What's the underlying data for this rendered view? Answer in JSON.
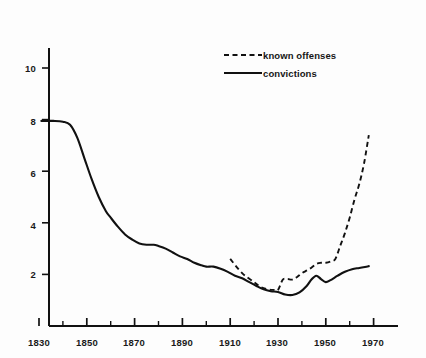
{
  "chart_data": {
    "type": "line",
    "title": "",
    "subtitle": "",
    "xlabel": "",
    "ylabel": "",
    "xlim": [
      1830,
      1976
    ],
    "ylim": [
      0,
      11
    ],
    "grid": false,
    "legend_position": "top-right",
    "y_ticks": [
      2,
      4,
      6,
      8,
      10
    ],
    "y_tick_labels": [
      "2",
      "4",
      "6",
      "8",
      "10"
    ],
    "x_ticks_major": [
      1830,
      1850,
      1870,
      1890,
      1910,
      1930,
      1950,
      1970
    ],
    "x_tick_labels": [
      "1830",
      "1850",
      "1870",
      "1890",
      "1910",
      "1930",
      "1950",
      "1970"
    ],
    "x_ticks_minor": [
      1840,
      1860,
      1880,
      1900,
      1920,
      1940,
      1960
    ],
    "series": [
      {
        "name": "known offenses",
        "style": "dashed",
        "color": "#111111",
        "x": [
          1910,
          1915,
          1920,
          1923,
          1926,
          1928,
          1930,
          1932,
          1934,
          1936,
          1938,
          1940,
          1943,
          1946,
          1948,
          1950,
          1952,
          1954,
          1956,
          1958,
          1960,
          1962,
          1964,
          1966,
          1968
        ],
        "values": [
          2.6,
          2.05,
          1.7,
          1.5,
          1.42,
          1.4,
          1.4,
          1.8,
          1.82,
          1.8,
          1.9,
          2.05,
          2.2,
          2.4,
          2.45,
          2.45,
          2.5,
          2.6,
          3.1,
          3.6,
          4.2,
          4.9,
          5.5,
          6.3,
          7.4
        ]
      },
      {
        "name": "convictions",
        "style": "solid",
        "color": "#111111",
        "x": [
          1831,
          1836,
          1840,
          1843,
          1846,
          1849,
          1852,
          1855,
          1858,
          1860,
          1863,
          1866,
          1869,
          1872,
          1875,
          1878,
          1880,
          1883,
          1886,
          1889,
          1892,
          1895,
          1898,
          1900,
          1903,
          1906,
          1909,
          1912,
          1915,
          1918,
          1921,
          1924,
          1927,
          1930,
          1933,
          1936,
          1939,
          1942,
          1944,
          1946,
          1948,
          1950,
          1952,
          1955,
          1958,
          1961,
          1964,
          1967,
          1968
        ],
        "values": [
          7.95,
          7.95,
          7.92,
          7.8,
          7.3,
          6.5,
          5.7,
          5.0,
          4.45,
          4.2,
          3.85,
          3.55,
          3.35,
          3.2,
          3.15,
          3.15,
          3.1,
          3.0,
          2.85,
          2.7,
          2.6,
          2.45,
          2.35,
          2.3,
          2.3,
          2.22,
          2.1,
          1.95,
          1.85,
          1.7,
          1.55,
          1.42,
          1.35,
          1.32,
          1.22,
          1.2,
          1.3,
          1.55,
          1.8,
          1.95,
          1.82,
          1.7,
          1.78,
          1.95,
          2.1,
          2.2,
          2.25,
          2.3,
          2.32
        ]
      }
    ]
  },
  "legend": {
    "entries": [
      {
        "label": "known offenses",
        "style": "dashed"
      },
      {
        "label": "convictions",
        "style": "solid"
      }
    ]
  },
  "axes": {
    "y_labels": [
      "10",
      "8",
      "6",
      "4",
      "2"
    ],
    "x_labels": [
      "1830",
      "1850",
      "1870",
      "1890",
      "1910",
      "1930",
      "1950",
      "1970"
    ]
  }
}
